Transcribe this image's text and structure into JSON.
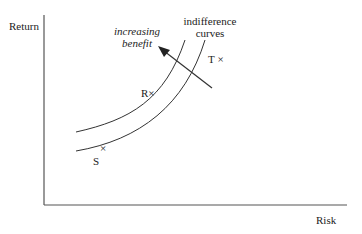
{
  "axes": {
    "y_label": "Return",
    "x_label": "Risk"
  },
  "annotations": {
    "arrow_label_line1": "increasing",
    "arrow_label_line2": "benefit",
    "curves_label_line1": "indifference",
    "curves_label_line2": "curves"
  },
  "points": {
    "R": "R",
    "S": "S",
    "T": "T",
    "marker": "×"
  },
  "colors": {
    "line": "#333333",
    "text": "#222222"
  }
}
